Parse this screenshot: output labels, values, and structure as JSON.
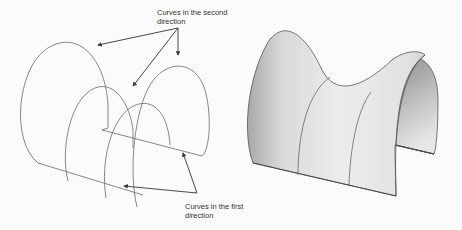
{
  "figure": {
    "left_panel": {
      "title": "Wireframe curves",
      "labels": {
        "second_direction": {
          "line1": "Curves in the second",
          "line2": "direction"
        },
        "first_direction": {
          "line1": "Curves in the first",
          "line2": "direction"
        }
      }
    },
    "right_panel": {
      "title": "Resulting surface"
    },
    "colors": {
      "background": "#fbfbfb",
      "curve_stroke": "#6a6a6a",
      "arrow_stroke": "#333333",
      "surface_light": "#eeeeee",
      "surface_dark": "#9a9a9a",
      "surface_edge": "#555555"
    }
  }
}
